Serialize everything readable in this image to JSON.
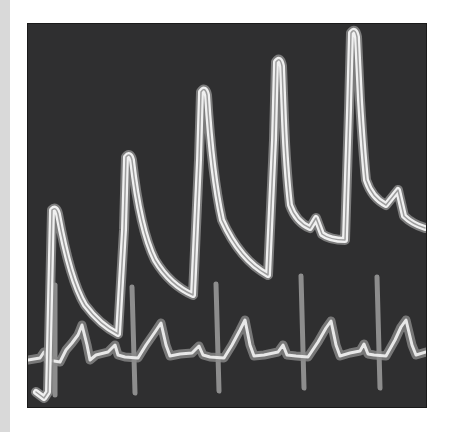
{
  "illustration": {
    "subject": "physiological waveform traces",
    "background_color": "#2f2f30",
    "trace_color": "#e6e6e6",
    "trace_glow_color": "#9a9a9a",
    "upper_trace": {
      "description": "stepwise rising pulsatile trace",
      "peaks": [
        [
          52,
          208
        ],
        [
          126,
          155
        ],
        [
          201,
          89
        ],
        [
          276,
          60
        ],
        [
          351,
          30
        ]
      ]
    },
    "lower_trace": {
      "description": "ECG trace",
      "r_wave_x": [
        55,
        132,
        216,
        301,
        377
      ]
    }
  }
}
